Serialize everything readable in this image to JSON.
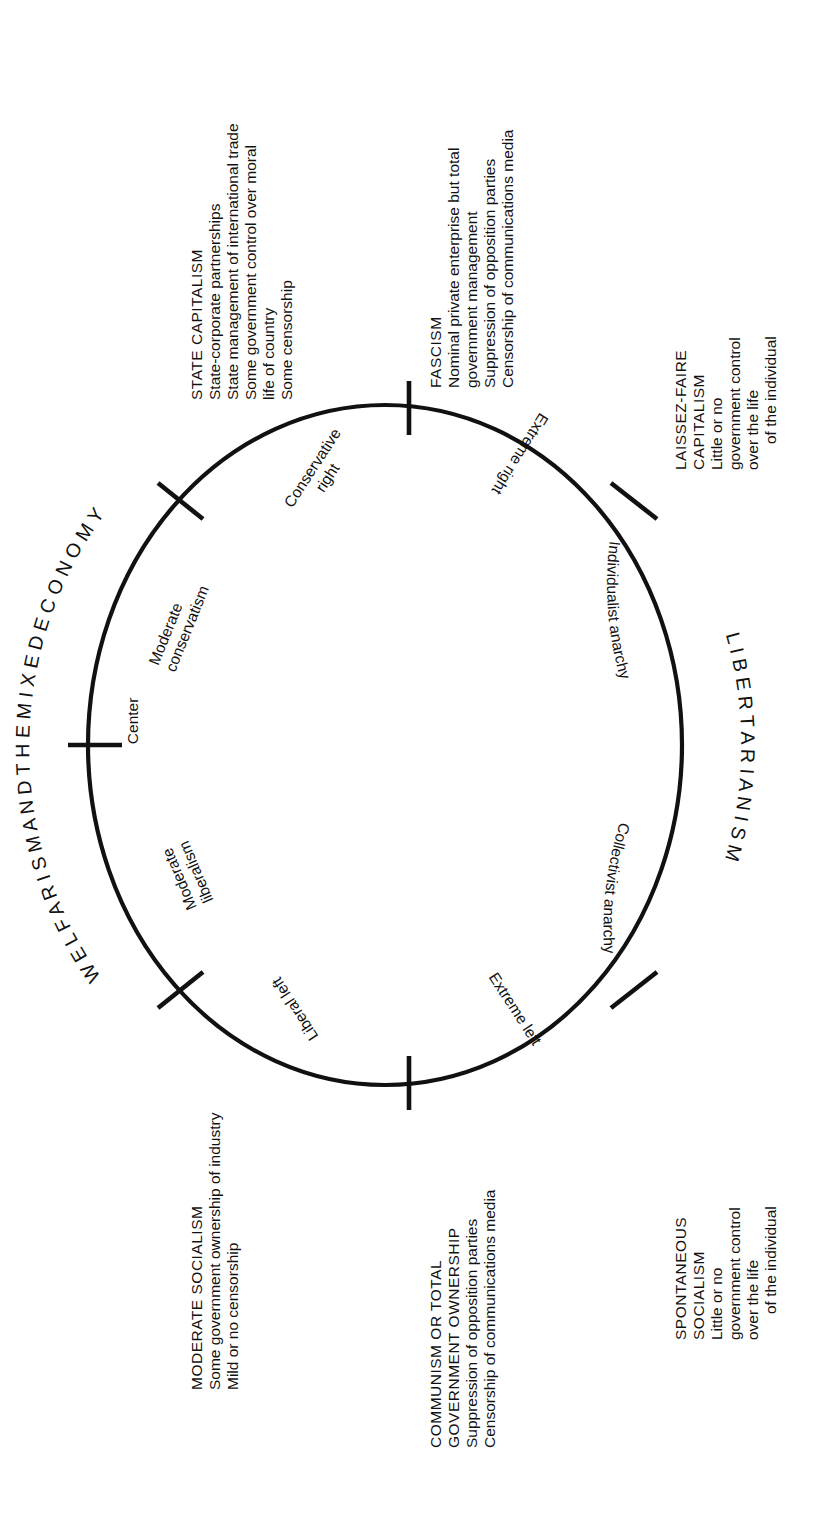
{
  "diagram": {
    "shape": "circle",
    "line_color": "#111111",
    "background": "#ffffff"
  },
  "arc_labels": [
    {
      "name": "welfarism-arc",
      "text": "W E L F A R I S M   A N D   T H E   M I X E D   E C O N O M Y"
    },
    {
      "name": "libertarianism-arc",
      "text": "L I B E R T A R I A N I S M"
    }
  ],
  "inner_labels": [
    {
      "name": "conservative-right",
      "line1": "Conservative",
      "line2": "right"
    },
    {
      "name": "extreme-right",
      "line1": "Extreme right",
      "line2": ""
    },
    {
      "name": "moderate-conservatism",
      "line1": "Moderate",
      "line2": "conservatism"
    },
    {
      "name": "center",
      "line1": "Center",
      "line2": ""
    },
    {
      "name": "moderate-liberalism",
      "line1": "Moderate",
      "line2": "liberalism"
    },
    {
      "name": "liberal-left",
      "line1": "Liberal left",
      "line2": ""
    },
    {
      "name": "extreme-left",
      "line1": "Extreme left",
      "line2": ""
    },
    {
      "name": "individualist-anarchy",
      "line1": "Individualist anarchy",
      "line2": ""
    },
    {
      "name": "collectivist-anarchy",
      "line1": "Collectivist anarchy",
      "line2": ""
    }
  ],
  "blocks": [
    {
      "name": "state-capitalism",
      "heading": "STATE CAPITALISM",
      "lines": [
        "State-corporate partnerships",
        "State management of international trade",
        "Some government control over moral",
        "life of country",
        "Some censorship"
      ]
    },
    {
      "name": "fascism",
      "heading": "FASCISM",
      "lines": [
        "Nominal private enterprise but total",
        "government management",
        "Suppression of opposition parties",
        "Censorship of communications media"
      ]
    },
    {
      "name": "laissez-faire-capitalism",
      "heading": "LAISSEZ-FAIRE CAPITALISM",
      "lines": [
        "Little or no government control over the life",
        "of the individual"
      ]
    },
    {
      "name": "spontaneous-socialism",
      "heading": "SPONTANEOUS SOCIALISM",
      "lines": [
        "Little or no government control over the life",
        "of the individual"
      ]
    },
    {
      "name": "communism",
      "heading": "COMMUNISM OR TOTAL",
      "heading2": "GOVERNMENT OWNERSHIP",
      "lines": [
        "Suppression of opposition parties",
        "Censorship of communications media"
      ]
    },
    {
      "name": "moderate-socialism",
      "heading": "MODERATE SOCIALISM",
      "lines": [
        "Some government ownership of industry",
        "Mild or no censorship"
      ]
    }
  ]
}
